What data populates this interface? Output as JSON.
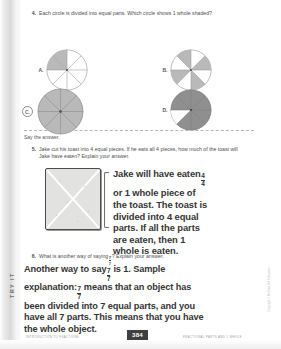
{
  "page": {
    "number": "384",
    "footer_left": "INTRODUCTION TO FRACTIONS",
    "footer_right": "FRACTIONAL PARTS AND 1 WHOLE",
    "side_tab": "TRY IT",
    "vertical_credit": "Copyright © McGraw-Hill Education"
  },
  "questions": [
    {
      "number": "4.",
      "prompt": "Each circle is divided into equal parts. Which circle shows 1 whole shaded?",
      "choices": [
        {
          "label": "A.",
          "parts": 8,
          "shaded": 2,
          "pattern": "quadrant",
          "selected": false
        },
        {
          "label": "B.",
          "parts": 8,
          "shaded": 4,
          "pattern": "alternating",
          "selected": false
        },
        {
          "label": "C.",
          "parts": 8,
          "shaded": 8,
          "pattern": "all",
          "selected": true
        },
        {
          "label": "D.",
          "parts": 8,
          "shaded": 7,
          "pattern": "all-but-one",
          "selected": false
        }
      ]
    },
    {
      "number": "5.",
      "instruction": "Say the answer.",
      "prompt": "Jake cut his toast into 4 equal pieces. If he eats all 4 pieces, how much of the toast will Jake have eaten? Explain your answer.",
      "figure": "toast-divided-in-fourths",
      "answer_lines": [
        "Jake will have eaten",
        "or 1 whole piece of",
        "the toast. The toast is",
        "divided into 4 equal",
        "parts. If all the parts",
        "are eaten, then 1",
        "whole is eaten."
      ],
      "answer_fraction": {
        "numerator": "4",
        "denominator": "4"
      }
    },
    {
      "number": "6.",
      "prompt_before": "What is another way of saying",
      "prompt_fraction": {
        "numerator": "7",
        "denominator": "7"
      },
      "prompt_after": "? Explain your answer.",
      "answer_lines": [
        "Another way to say",
        "is 1. Sample",
        "explanation:",
        "means that an object has",
        "been divided into 7 equal parts, and you",
        "have all 7 parts. This means that you have",
        "the whole object."
      ],
      "answer_fraction": {
        "numerator": "7",
        "denominator": "7"
      }
    }
  ],
  "colors": {
    "shade_light": "#b9b9b9",
    "shade_dark": "#8f8f8f",
    "circle_stroke": "#9a9a9a",
    "text": "#4f4f4f",
    "answer_text": "#353535",
    "badge_bg": "#3f3f3f"
  }
}
